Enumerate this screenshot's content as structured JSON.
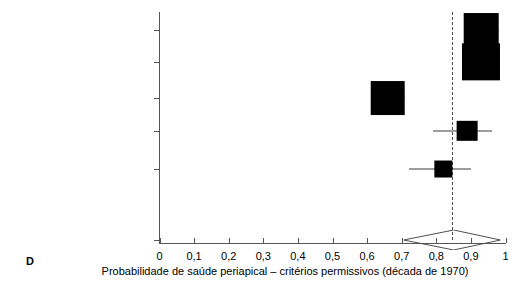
{
  "panel": {
    "label": "D"
  },
  "axis": {
    "x_title": "Probabilidade de saúde periapical – critérios permissivos (década de 1970)",
    "x_ticks": [
      "0",
      "0,1",
      "0,2",
      "0,3",
      "0,4",
      "0,5",
      "0,6",
      "0,7",
      "0,8",
      "0,9",
      "1"
    ],
    "x_tick_values": [
      0,
      0.1,
      0.2,
      0.3,
      0.4,
      0.5,
      0.6,
      0.7,
      0.8,
      0.9,
      1
    ],
    "x_min": 0,
    "x_max": 1
  },
  "chart_data": {
    "type": "forest",
    "title": "",
    "xlabel": "Probabilidade de saúde periapical – critérios permissivos (década de 1970)",
    "ylabel": "",
    "xlim": [
      0,
      1
    ],
    "grid": false,
    "legend": "none",
    "reference_line": 0.845,
    "categories": [
      "Selden 1974",
      "Adenubi e Rule 1976",
      "Jokinen et al. 1978",
      "Soltanof 1978",
      "Heling e Kischinovsky 1979",
      "Combinado"
    ],
    "studies": [
      {
        "label": "Selden 1974",
        "estimate": 0.93,
        "ci_low": 0.88,
        "ci_high": 0.98,
        "weight_box": 0.1,
        "row": 0
      },
      {
        "label": "Adenubi e Rule 1976",
        "estimate": 0.93,
        "ci_low": 0.9,
        "ci_high": 0.96,
        "weight_box": 0.11,
        "row": 1
      },
      {
        "label": "Jokinen et al. 1978",
        "estimate": 0.66,
        "ci_low": 0.61,
        "ci_high": 0.71,
        "weight_box": 0.1,
        "row": 2
      },
      {
        "label": "Soltanof 1978",
        "estimate": 0.89,
        "ci_low": 0.79,
        "ci_high": 0.96,
        "weight_box": 0.06,
        "row": 3
      },
      {
        "label": "Heling e Kischinovsky 1979",
        "estimate": 0.82,
        "ci_low": 0.72,
        "ci_high": 0.9,
        "weight_box": 0.05,
        "row": 4
      }
    ],
    "summary": {
      "label": "Combinado",
      "estimate": 0.845,
      "ci_low": 0.7,
      "ci_high": 0.98,
      "row": 5
    }
  }
}
